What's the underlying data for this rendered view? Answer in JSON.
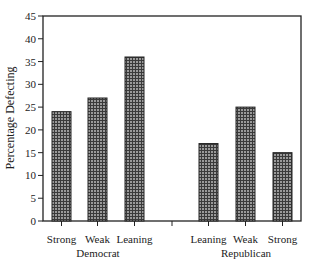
{
  "chart_data": {
    "type": "bar",
    "title": "",
    "xlabel": "",
    "ylabel": "Percentage Defecting",
    "ylim": [
      0,
      45
    ],
    "yticks": [
      0,
      5,
      10,
      15,
      20,
      25,
      30,
      35,
      40,
      45
    ],
    "grid": false,
    "legend": null,
    "groups": [
      {
        "name": "Democrat",
        "categories": [
          "Strong",
          "Weak",
          "Leaning"
        ],
        "values": [
          24,
          27,
          36
        ]
      },
      {
        "name": "Republican",
        "categories": [
          "Leaning",
          "Weak",
          "Strong"
        ],
        "values": [
          17,
          25,
          15
        ]
      }
    ],
    "categories": [
      "Strong",
      "Weak",
      "Leaning",
      "",
      "Leaning",
      "Weak",
      "Strong"
    ],
    "values": [
      24,
      27,
      36,
      null,
      17,
      25,
      15
    ],
    "bar_fill": "crosshatch-gray"
  },
  "colors": {
    "axis": "#222222",
    "bar_fill": "#8a8a8a",
    "bar_hatch": "#3a3a3a",
    "bar_stroke": "#222222"
  }
}
